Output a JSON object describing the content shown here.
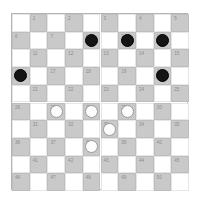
{
  "diagram": {
    "kind": "international-draughts-board",
    "rows": 10,
    "columns": 10,
    "colors": {
      "dark_square": "#c9c9c9",
      "light_square": "#ffffff",
      "board_border": "#b4b4b4",
      "square_border": "#bdbdbd",
      "number_text": "#8c8c8c",
      "black_piece": "#151515",
      "white_piece": "#fdfdfd",
      "white_piece_border": "#9a9a9a"
    },
    "numbered_squares": [
      {
        "n": "1",
        "row": 1,
        "col": 2,
        "piece": ""
      },
      {
        "n": "2",
        "row": 1,
        "col": 4,
        "piece": ""
      },
      {
        "n": "3",
        "row": 1,
        "col": 6,
        "piece": ""
      },
      {
        "n": "4",
        "row": 1,
        "col": 8,
        "piece": ""
      },
      {
        "n": "5",
        "row": 1,
        "col": 10,
        "piece": ""
      },
      {
        "n": "6",
        "row": 2,
        "col": 1,
        "piece": ""
      },
      {
        "n": "7",
        "row": 2,
        "col": 3,
        "piece": ""
      },
      {
        "n": "8",
        "row": 2,
        "col": 5,
        "piece": "black"
      },
      {
        "n": "9",
        "row": 2,
        "col": 7,
        "piece": "black"
      },
      {
        "n": "10",
        "row": 2,
        "col": 9,
        "piece": "black"
      },
      {
        "n": "11",
        "row": 3,
        "col": 2,
        "piece": ""
      },
      {
        "n": "12",
        "row": 3,
        "col": 4,
        "piece": ""
      },
      {
        "n": "13",
        "row": 3,
        "col": 6,
        "piece": ""
      },
      {
        "n": "14",
        "row": 3,
        "col": 8,
        "piece": ""
      },
      {
        "n": "15",
        "row": 3,
        "col": 10,
        "piece": ""
      },
      {
        "n": "16",
        "row": 4,
        "col": 1,
        "piece": "black"
      },
      {
        "n": "17",
        "row": 4,
        "col": 3,
        "piece": ""
      },
      {
        "n": "18",
        "row": 4,
        "col": 5,
        "piece": ""
      },
      {
        "n": "19",
        "row": 4,
        "col": 7,
        "piece": ""
      },
      {
        "n": "20",
        "row": 4,
        "col": 9,
        "piece": "black"
      },
      {
        "n": "21",
        "row": 5,
        "col": 2,
        "piece": ""
      },
      {
        "n": "22",
        "row": 5,
        "col": 4,
        "piece": ""
      },
      {
        "n": "23",
        "row": 5,
        "col": 6,
        "piece": ""
      },
      {
        "n": "24",
        "row": 5,
        "col": 8,
        "piece": ""
      },
      {
        "n": "25",
        "row": 5,
        "col": 10,
        "piece": ""
      },
      {
        "n": "26",
        "row": 6,
        "col": 1,
        "piece": ""
      },
      {
        "n": "27",
        "row": 6,
        "col": 3,
        "piece": "white"
      },
      {
        "n": "28",
        "row": 6,
        "col": 5,
        "piece": "white"
      },
      {
        "n": "29",
        "row": 6,
        "col": 7,
        "piece": "white"
      },
      {
        "n": "30",
        "row": 6,
        "col": 9,
        "piece": ""
      },
      {
        "n": "31",
        "row": 7,
        "col": 2,
        "piece": ""
      },
      {
        "n": "32",
        "row": 7,
        "col": 4,
        "piece": ""
      },
      {
        "n": "33",
        "row": 7,
        "col": 6,
        "piece": "white"
      },
      {
        "n": "34",
        "row": 7,
        "col": 8,
        "piece": ""
      },
      {
        "n": "35",
        "row": 7,
        "col": 10,
        "piece": ""
      },
      {
        "n": "36",
        "row": 8,
        "col": 1,
        "piece": ""
      },
      {
        "n": "37",
        "row": 8,
        "col": 3,
        "piece": ""
      },
      {
        "n": "38",
        "row": 8,
        "col": 5,
        "piece": "white"
      },
      {
        "n": "39",
        "row": 8,
        "col": 7,
        "piece": ""
      },
      {
        "n": "40",
        "row": 8,
        "col": 9,
        "piece": ""
      },
      {
        "n": "41",
        "row": 9,
        "col": 2,
        "piece": ""
      },
      {
        "n": "42",
        "row": 9,
        "col": 4,
        "piece": ""
      },
      {
        "n": "43",
        "row": 9,
        "col": 6,
        "piece": ""
      },
      {
        "n": "44",
        "row": 9,
        "col": 8,
        "piece": ""
      },
      {
        "n": "45",
        "row": 9,
        "col": 10,
        "piece": ""
      },
      {
        "n": "46",
        "row": 10,
        "col": 1,
        "piece": ""
      },
      {
        "n": "47",
        "row": 10,
        "col": 3,
        "piece": ""
      },
      {
        "n": "48",
        "row": 10,
        "col": 5,
        "piece": ""
      },
      {
        "n": "49",
        "row": 10,
        "col": 7,
        "piece": ""
      },
      {
        "n": "50",
        "row": 10,
        "col": 9,
        "piece": ""
      }
    ]
  }
}
